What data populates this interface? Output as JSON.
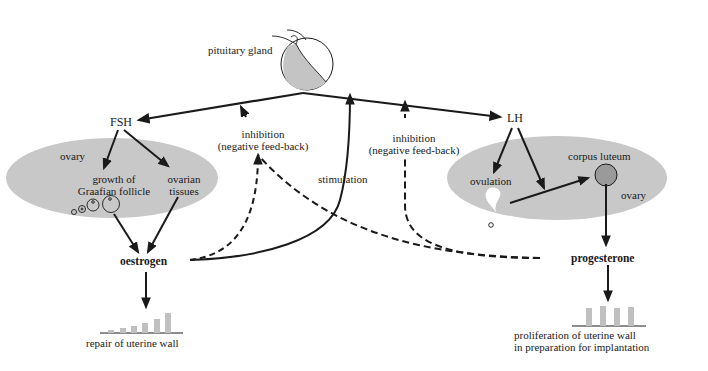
{
  "diagram": {
    "type": "hormone-feedback-flowchart",
    "nodes": {
      "pituitary": {
        "label": "pituitary gland"
      },
      "fsh": {
        "label": "FSH"
      },
      "lh": {
        "label": "LH"
      },
      "ovary_left": {
        "label": "ovary",
        "growth_line1": "growth of",
        "growth_line2": "Graafian follicle",
        "tissues_line1": "ovarian",
        "tissues_line2": "tissues"
      },
      "ovary_right": {
        "label": "ovary",
        "ovulation": "ovulation",
        "corpus_luteum": "corpus luteum"
      },
      "oestrogen": {
        "label": "oestrogen"
      },
      "progesterone": {
        "label": "progesterone"
      },
      "repair": {
        "label": "repair of uterine wall"
      },
      "proliferation": {
        "line1": "proliferation of uterine wall",
        "line2": "in preparation for  implantation"
      }
    },
    "edge_labels": {
      "inhibition_left_line1": "inhibition",
      "inhibition_left_line2": "(negative feed-back)",
      "inhibition_right_line1": "inhibition",
      "inhibition_right_line2": "(negative feed-back)",
      "stimulation": "stimulation"
    },
    "edges": [
      {
        "from": "pituitary",
        "to": "fsh",
        "style": "solid"
      },
      {
        "from": "pituitary",
        "to": "lh",
        "style": "solid"
      },
      {
        "from": "fsh",
        "to": "growth of Graafian follicle",
        "style": "solid"
      },
      {
        "from": "fsh",
        "to": "ovarian tissues",
        "style": "solid"
      },
      {
        "from": "Graafian follicle",
        "to": "oestrogen",
        "style": "solid"
      },
      {
        "from": "ovarian tissues",
        "to": "oestrogen",
        "style": "solid"
      },
      {
        "from": "oestrogen",
        "to": "repair",
        "style": "solid"
      },
      {
        "from": "oestrogen",
        "to": "pituitary (FSH inhibition)",
        "style": "dashed"
      },
      {
        "from": "oestrogen",
        "to": "pituitary (LH stimulation)",
        "style": "solid"
      },
      {
        "from": "lh",
        "to": "ovulation",
        "style": "solid"
      },
      {
        "from": "lh",
        "to": "corpus luteum",
        "style": "solid"
      },
      {
        "from": "ovulation",
        "to": "corpus luteum",
        "style": "solid"
      },
      {
        "from": "corpus luteum",
        "to": "progesterone",
        "style": "solid"
      },
      {
        "from": "progesterone",
        "to": "pituitary (FSH inhibition)",
        "style": "dashed"
      },
      {
        "from": "progesterone",
        "to": "pituitary (LH inhibition)",
        "style": "dashed"
      },
      {
        "from": "progesterone",
        "to": "proliferation",
        "style": "solid"
      }
    ],
    "colors": {
      "ink": "#1a1a1a",
      "ovary_fill": "#c8c8c8",
      "gland_shade": "#c4c4c4",
      "corpus_fill": "#9a9a9a",
      "uterine_bars": "#c0c0c0"
    }
  }
}
